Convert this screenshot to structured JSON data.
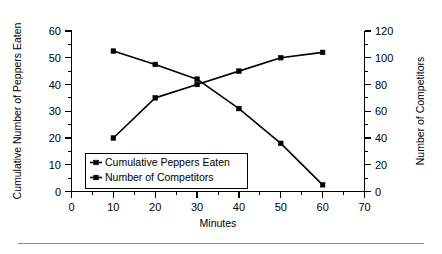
{
  "chart_data": {
    "type": "line",
    "title": "",
    "xlabel": "Minutes",
    "ylabel": "Cumulative Number of Peppers Eaten",
    "y2label": "Number of Competitors",
    "x": [
      10,
      20,
      30,
      40,
      50,
      60
    ],
    "xlim": [
      0,
      70
    ],
    "ylim": [
      0,
      60
    ],
    "y2lim": [
      0,
      120
    ],
    "xticks": [
      0,
      10,
      20,
      30,
      40,
      50,
      60,
      70
    ],
    "xtick_labels": [
      "0",
      "10",
      "20",
      "30",
      "40",
      "50",
      "60",
      "70"
    ],
    "yticks": [
      0,
      10,
      20,
      30,
      40,
      50,
      60
    ],
    "ytick_labels": [
      "0",
      "10",
      "20",
      "30",
      "40",
      "50",
      "60"
    ],
    "y2ticks": [
      0,
      20,
      40,
      60,
      80,
      100,
      120
    ],
    "y2tick_labels": [
      "0",
      "20",
      "40",
      "60",
      "80",
      "100",
      "120"
    ],
    "grid": false,
    "legend_position": "inside-lower-left",
    "series": [
      {
        "name": "Cumulative Peppers Eaten",
        "axis": "left",
        "marker": "square",
        "color": "#000000",
        "values": [
          20,
          35,
          40,
          45,
          50,
          52
        ]
      },
      {
        "name": "Number of Competitors",
        "axis": "right",
        "marker": "square",
        "color": "#000000",
        "values": [
          105,
          95,
          84,
          62,
          36,
          5
        ]
      }
    ]
  },
  "legend": {
    "entries": [
      {
        "label": "Cumulative Peppers Eaten"
      },
      {
        "label": "Number of Competitors"
      }
    ]
  },
  "colors": {
    "foreground": "#000000",
    "background": "#ffffff",
    "rule": "#8d8d8d"
  }
}
